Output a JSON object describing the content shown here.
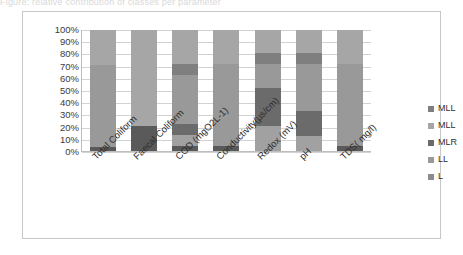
{
  "caption_remnant": "Figure: relative contribution of classes per parameter",
  "chart_data": {
    "type": "bar",
    "subtype": "stacked-100-percent",
    "title": "",
    "xlabel": "",
    "ylabel": "",
    "ylim": [
      0,
      100
    ],
    "y_ticks": [
      "0%",
      "10%",
      "20%",
      "30%",
      "40%",
      "50%",
      "60%",
      "70%",
      "80%",
      "90%",
      "100%"
    ],
    "grid": true,
    "legend_position": "right",
    "categories": [
      "Total Coliform",
      "Faecal Coliform",
      "COD (mgO2L-1)",
      "Conductivity(µs/cm)",
      "Redox (mV)",
      "pH",
      "TDS( mg/l)"
    ],
    "series": [
      {
        "name": "MLL",
        "color": "#a6a6a6",
        "values": [
          29,
          79,
          28,
          28,
          19,
          19,
          28
        ]
      },
      {
        "name": "MLL",
        "color": "#7f7f7f",
        "values": [
          0,
          0,
          9,
          0,
          9,
          9,
          0
        ]
      },
      {
        "name": "MLR",
        "color": "#6b6b6b",
        "values": [
          0,
          0,
          41,
          0,
          20,
          39,
          0
        ]
      },
      {
        "name": "LL",
        "color": "#999999",
        "values": [
          68,
          0,
          9,
          68,
          31,
          21,
          68
        ]
      },
      {
        "name": "L",
        "color": "#5a5a5a",
        "values": [
          3,
          21,
          13,
          4,
          21,
          12,
          4
        ]
      }
    ],
    "stacks": [
      {
        "category": "Total Coliform",
        "segments": [
          {
            "legend": "L",
            "from": 0,
            "to": 3,
            "color": "#5a5a5a"
          },
          {
            "legend": "LL",
            "from": 3,
            "to": 71,
            "color": "#999999"
          },
          {
            "legend": "MLL",
            "from": 71,
            "to": 100,
            "color": "#a6a6a6"
          }
        ]
      },
      {
        "category": "Faecal Coliform",
        "segments": [
          {
            "legend": "L",
            "from": 0,
            "to": 21,
            "color": "#5a5a5a"
          },
          {
            "legend": "MLL",
            "from": 21,
            "to": 100,
            "color": "#a6a6a6"
          }
        ]
      },
      {
        "category": "COD (mgO2L-1)",
        "segments": [
          {
            "legend": "L",
            "from": 0,
            "to": 4,
            "color": "#5a5a5a"
          },
          {
            "legend": "LL",
            "from": 4,
            "to": 13,
            "color": "#a1a1a1"
          },
          {
            "legend": "MLR",
            "from": 13,
            "to": 22,
            "color": "#6b6b6b"
          },
          {
            "legend": "LL",
            "from": 22,
            "to": 63,
            "color": "#999999"
          },
          {
            "legend": "MLL",
            "from": 63,
            "to": 72,
            "color": "#7f7f7f"
          },
          {
            "legend": "MLL",
            "from": 72,
            "to": 100,
            "color": "#a6a6a6"
          }
        ]
      },
      {
        "category": "Conductivity(µs/cm)",
        "segments": [
          {
            "legend": "L",
            "from": 0,
            "to": 4,
            "color": "#5a5a5a"
          },
          {
            "legend": "LL",
            "from": 4,
            "to": 72,
            "color": "#999999"
          },
          {
            "legend": "MLL",
            "from": 72,
            "to": 100,
            "color": "#a6a6a6"
          }
        ]
      },
      {
        "category": "Redox (mV)",
        "segments": [
          {
            "legend": "L",
            "from": 0,
            "to": 21,
            "color": "#a1a1a1"
          },
          {
            "legend": "MLR",
            "from": 21,
            "to": 52,
            "color": "#6b6b6b"
          },
          {
            "legend": "LL",
            "from": 52,
            "to": 72,
            "color": "#999999"
          },
          {
            "legend": "MLL",
            "from": 72,
            "to": 81,
            "color": "#7f7f7f"
          },
          {
            "legend": "MLL",
            "from": 81,
            "to": 100,
            "color": "#a6a6a6"
          }
        ]
      },
      {
        "category": "pH",
        "segments": [
          {
            "legend": "L",
            "from": 0,
            "to": 12,
            "color": "#a1a1a1"
          },
          {
            "legend": "MLR",
            "from": 12,
            "to": 33,
            "color": "#6b6b6b"
          },
          {
            "legend": "LL",
            "from": 33,
            "to": 72,
            "color": "#999999"
          },
          {
            "legend": "MLL",
            "from": 72,
            "to": 81,
            "color": "#7f7f7f"
          },
          {
            "legend": "MLL",
            "from": 81,
            "to": 100,
            "color": "#a6a6a6"
          }
        ]
      },
      {
        "category": "TDS( mg/l)",
        "segments": [
          {
            "legend": "L",
            "from": 0,
            "to": 4,
            "color": "#5a5a5a"
          },
          {
            "legend": "LL",
            "from": 4,
            "to": 72,
            "color": "#999999"
          },
          {
            "legend": "MLL",
            "from": 72,
            "to": 100,
            "color": "#a6a6a6"
          }
        ]
      }
    ],
    "legend": [
      {
        "label": "MLL",
        "color": "#7f7f7f"
      },
      {
        "label": "MLL",
        "color": "#a6a6a6"
      },
      {
        "label": "MLR",
        "color": "#6b6b6b"
      },
      {
        "label": "LL",
        "color": "#999999"
      },
      {
        "label": "L",
        "color": "#8c8c8c"
      }
    ]
  }
}
